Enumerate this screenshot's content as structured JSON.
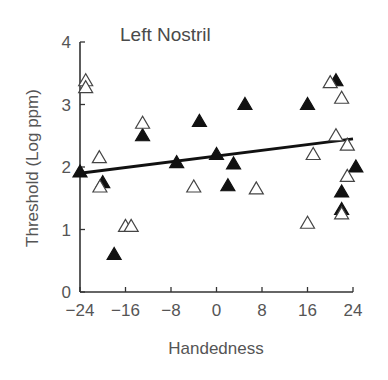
{
  "chart_data": {
    "type": "scatter",
    "title": "Left Nostril",
    "xlabel": "Handedness",
    "ylabel": "Threshold (Log ppm)",
    "xlim": [
      -24,
      24
    ],
    "ylim": [
      0,
      4
    ],
    "xticks": [
      -24,
      -16,
      -8,
      0,
      8,
      16,
      24
    ],
    "xtick_labels": [
      "-24",
      "-16",
      "-8",
      "0",
      "8",
      "16",
      "24"
    ],
    "yticks": [
      0,
      1,
      2,
      3,
      4
    ],
    "ytick_labels": [
      "0",
      "1",
      "2",
      "3",
      "4"
    ],
    "grid": false,
    "legend": null,
    "series": [
      {
        "name": "filled triangles",
        "marker": "filled-triangle",
        "points": [
          {
            "x": -24,
            "y": 1.92
          },
          {
            "x": -20,
            "y": 1.75
          },
          {
            "x": -18,
            "y": 0.6
          },
          {
            "x": -13,
            "y": 2.5
          },
          {
            "x": -7,
            "y": 2.07
          },
          {
            "x": -3,
            "y": 2.73
          },
          {
            "x": 0,
            "y": 2.2
          },
          {
            "x": 2,
            "y": 1.7
          },
          {
            "x": 3,
            "y": 2.05
          },
          {
            "x": 5,
            "y": 3.0
          },
          {
            "x": 16,
            "y": 3.0
          },
          {
            "x": 21,
            "y": 3.38
          },
          {
            "x": 22,
            "y": 1.6
          },
          {
            "x": 22,
            "y": 1.32
          },
          {
            "x": 24.5,
            "y": 2.0
          }
        ]
      },
      {
        "name": "open triangles",
        "marker": "open-triangle",
        "points": [
          {
            "x": -23,
            "y": 3.38
          },
          {
            "x": -23,
            "y": 3.27
          },
          {
            "x": -20.6,
            "y": 2.15
          },
          {
            "x": -20.5,
            "y": 1.68
          },
          {
            "x": -16,
            "y": 1.05
          },
          {
            "x": -15,
            "y": 1.05
          },
          {
            "x": -13,
            "y": 2.7
          },
          {
            "x": -4,
            "y": 1.68
          },
          {
            "x": 7,
            "y": 1.65
          },
          {
            "x": 16,
            "y": 1.1
          },
          {
            "x": 17,
            "y": 2.2
          },
          {
            "x": 20,
            "y": 3.35
          },
          {
            "x": 21,
            "y": 2.5
          },
          {
            "x": 22,
            "y": 3.1
          },
          {
            "x": 22,
            "y": 1.25
          },
          {
            "x": 23,
            "y": 2.35
          },
          {
            "x": 23,
            "y": 1.85
          }
        ]
      }
    ],
    "regression_line": {
      "x1": -24,
      "y1": 1.9,
      "x2": 24,
      "y2": 2.45
    }
  }
}
